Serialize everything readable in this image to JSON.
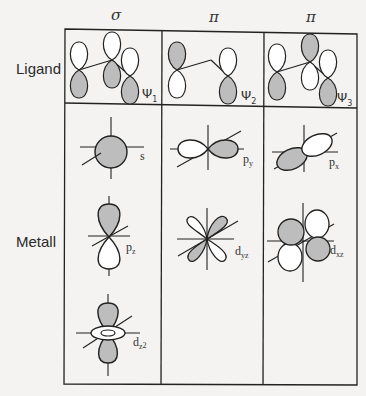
{
  "columns": [
    {
      "symmetry": "σ",
      "ligand_orbital": "Ψ",
      "ligand_index": "1"
    },
    {
      "symmetry": "π",
      "ligand_orbital": "Ψ",
      "ligand_index": "2"
    },
    {
      "symmetry": "π",
      "ligand_orbital": "Ψ",
      "ligand_index": "3"
    }
  ],
  "rows": {
    "ligand": "Ligand",
    "metal": "Metall"
  },
  "metal_orbitals": {
    "sigma": [
      {
        "base": "s",
        "sub": ""
      },
      {
        "base": "p",
        "sub": "z"
      },
      {
        "base": "d",
        "sub": "z",
        "sup": "2"
      }
    ],
    "pi_1": [
      {
        "base": "p",
        "sub": "y"
      },
      {
        "base": "d",
        "sub": "yz"
      }
    ],
    "pi_2": [
      {
        "base": "p",
        "sub": "x"
      },
      {
        "base": "d",
        "sub": "xz"
      }
    ]
  },
  "colors": {
    "line": "#222222",
    "shade": "#bdbdbd",
    "unshaded": "#ffffff",
    "background": "#f4f3f1"
  }
}
